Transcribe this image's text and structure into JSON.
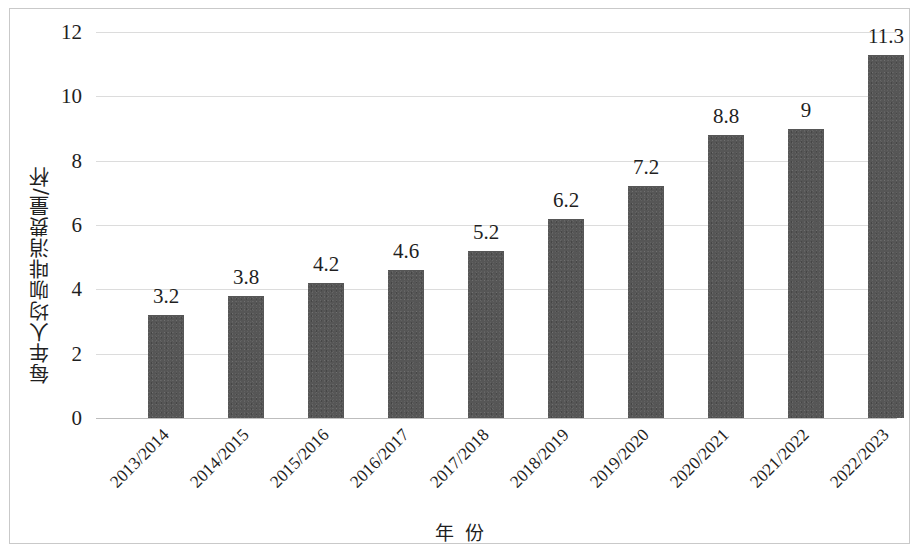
{
  "chart_data": {
    "type": "bar",
    "title": "",
    "xlabel": "年 份",
    "ylabel": "每年人均咖啡消费量/杯",
    "categories": [
      "2013/2014",
      "2014/2015",
      "2015/2016",
      "2016/2017",
      "2017/2018",
      "2018/2019",
      "2019/2020",
      "2020/2021",
      "2021/2022",
      "2022/2023"
    ],
    "values": [
      3.2,
      3.8,
      4.2,
      4.6,
      5.2,
      6.2,
      7.2,
      8.8,
      9,
      11.3
    ],
    "value_labels": [
      "3.2",
      "3.8",
      "4.2",
      "4.6",
      "5.2",
      "6.2",
      "7.2",
      "8.8",
      "9",
      "11.3"
    ],
    "ylim": [
      0,
      12
    ],
    "yticks": [
      0,
      2,
      4,
      6,
      8,
      10,
      12
    ],
    "ytick_labels": [
      "0",
      "2",
      "4",
      "6",
      "8",
      "10",
      "12"
    ],
    "grid": true,
    "grid_axis": "y",
    "legend": false,
    "legend_position": "none",
    "series": [
      {
        "name": "每年人均咖啡消费量/杯",
        "values": [
          3.2,
          3.8,
          4.2,
          4.6,
          5.2,
          6.2,
          7.2,
          8.8,
          9,
          11.3
        ]
      }
    ],
    "colors": {
      "bar_fill": "#565656",
      "gridline": "#dcdcdc",
      "axis_line": "#bdbdbd",
      "frame_border": "#c9c9c9",
      "text": "#1f1f1f",
      "background": "#ffffff"
    }
  }
}
